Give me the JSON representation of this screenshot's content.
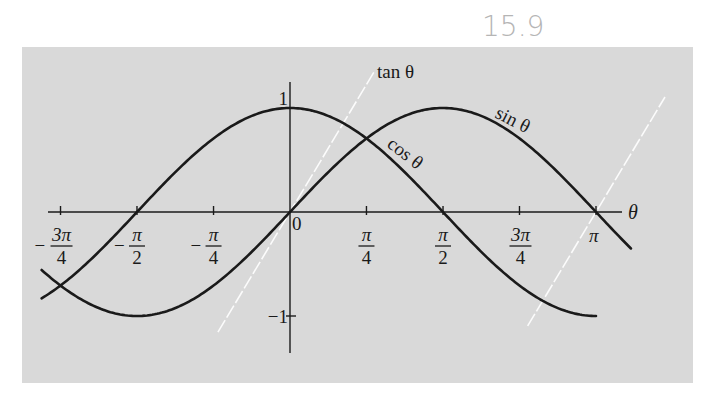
{
  "annotation": {
    "handwritten_label": "15.9"
  },
  "colors": {
    "panel_bg": "#d9d9d9",
    "curve": "#1a1a1a",
    "tan_line": "#ffffff",
    "page_bg": "#ffffff"
  },
  "chart_data": {
    "type": "line",
    "title": "",
    "xlabel": "θ",
    "ylabel": "",
    "xlim": [
      -2.5,
      3.3
    ],
    "ylim": [
      -1.35,
      1.25
    ],
    "grid": false,
    "legend": "inline labels on curves",
    "x_ticks": [
      {
        "value": -2.356,
        "numerator": "3π",
        "denominator": "4",
        "sign": "−"
      },
      {
        "value": -1.571,
        "numerator": "π",
        "denominator": "2",
        "sign": "−"
      },
      {
        "value": -0.785,
        "numerator": "π",
        "denominator": "4",
        "sign": "−"
      },
      {
        "value": 0,
        "label": "0"
      },
      {
        "value": 0.785,
        "numerator": "π",
        "denominator": "4",
        "sign": ""
      },
      {
        "value": 1.571,
        "numerator": "π",
        "denominator": "2",
        "sign": ""
      },
      {
        "value": 2.356,
        "numerator": "3π",
        "denominator": "4",
        "sign": ""
      },
      {
        "value": 3.1416,
        "label": "π"
      }
    ],
    "y_ticks": [
      {
        "value": 1,
        "label": "1"
      },
      {
        "value": -1,
        "label": "−1"
      }
    ],
    "series": [
      {
        "name": "sin θ",
        "label": "sin θ",
        "function": "sin",
        "x_range": [
          -2.55,
          3.5
        ],
        "style": "solid",
        "x": [
          -2.356,
          -1.571,
          -0.785,
          0,
          0.785,
          1.571,
          2.356,
          3.1416
        ],
        "values": [
          -0.707,
          -1,
          -0.707,
          0,
          0.707,
          1,
          0.707,
          0
        ]
      },
      {
        "name": "cos θ",
        "label": "cos θ",
        "function": "cos",
        "x_range": [
          -2.55,
          3.1416
        ],
        "style": "solid",
        "x": [
          -2.356,
          -1.571,
          -0.785,
          0,
          0.785,
          1.571,
          2.356,
          3.1416
        ],
        "values": [
          -0.707,
          0,
          0.707,
          1,
          0.707,
          0,
          -0.707,
          -1
        ]
      },
      {
        "name": "tan θ",
        "label": "tan θ",
        "function": "tan_approx_lines",
        "style": "dashed-white",
        "segments": [
          {
            "through_x": 0,
            "x_range": [
              -0.74,
              0.86
            ]
          },
          {
            "through_x": 3.1416,
            "x_range": [
              2.44,
              3.85
            ]
          }
        ]
      }
    ]
  }
}
